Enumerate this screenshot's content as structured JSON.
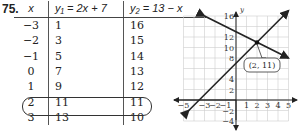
{
  "problem": {
    "number": "75."
  },
  "table": {
    "headers": [
      "x",
      "y₁ = 2x + 7",
      "y₂ = 13 − x"
    ],
    "rows": [
      [
        "−3",
        "1",
        "16"
      ],
      [
        "−2",
        "3",
        "15"
      ],
      [
        "−1",
        "5",
        "14"
      ],
      [
        "0",
        "7",
        "13"
      ],
      [
        "1",
        "9",
        "12"
      ],
      [
        "2",
        "11",
        "11"
      ],
      [
        "3",
        "13",
        "10"
      ]
    ],
    "highlighted_row_index": 5
  },
  "chart_data": {
    "type": "line",
    "title": "",
    "xlabel": "",
    "ylabel": "y",
    "xlim": [
      -5,
      5
    ],
    "ylim": [
      -4,
      16
    ],
    "grid": true,
    "x_ticks": [
      "−5",
      "−3",
      "−2",
      "−1",
      "1",
      "2",
      "3",
      "4",
      "5"
    ],
    "y_ticks": [
      "16",
      "12",
      "10",
      "8",
      "4",
      "2",
      "−2",
      "−4"
    ],
    "series": [
      {
        "name": "y1 = 2x + 7",
        "points": [
          [
            -4.5,
            -2
          ],
          [
            5,
            17
          ]
        ]
      },
      {
        "name": "y2 = 13 - x",
        "points": [
          [
            -3,
            16
          ],
          [
            5,
            8
          ]
        ]
      }
    ],
    "annotations": [
      {
        "label": "(2, 11)",
        "x": 2,
        "y": 11
      }
    ]
  }
}
